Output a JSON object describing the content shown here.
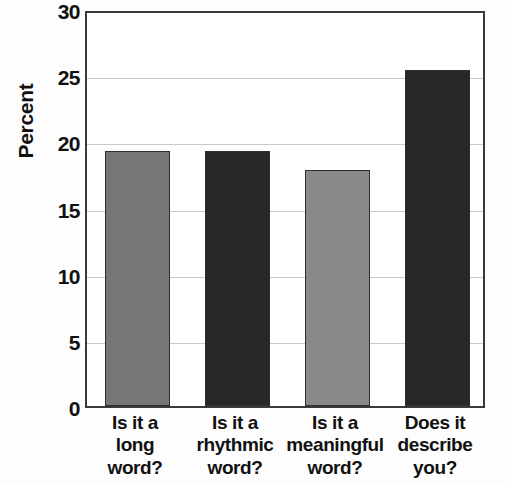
{
  "chart_data": {
    "type": "bar",
    "title": "",
    "subtitle": "",
    "xlabel": "",
    "ylabel": "Percent",
    "ylim": [
      0,
      30
    ],
    "yticks": [
      0,
      5,
      10,
      15,
      20,
      25,
      30
    ],
    "ytick_labels": [
      "0",
      "5",
      "10",
      "15",
      "20",
      "25",
      "30"
    ],
    "grid": true,
    "legend": false,
    "legend_position": "none",
    "categories": [
      "Is it a long word?",
      "Is it a rhythmic word?",
      "Is it a meaningful word?",
      "Does it describe you?"
    ],
    "category_lines": [
      [
        "Is it a",
        "long",
        "word?"
      ],
      [
        "Is it a",
        "rhythmic",
        "word?"
      ],
      [
        "Is it a",
        "meaningful",
        "word?"
      ],
      [
        "Does it",
        "describe",
        "you?"
      ]
    ],
    "values": [
      19.3,
      19.3,
      17.8,
      25.4
    ],
    "bar_colors": [
      "#767676",
      "#282828",
      "#8a8a8a",
      "#282828"
    ],
    "bar_border_color": "#2e2e2e"
  },
  "style": {
    "plot_background": "#ffffff",
    "page_background": "#fdfdfd",
    "axis_color": "#3a3a3a",
    "gridline_color": "#c9c9c9",
    "text_color": "#111111"
  }
}
